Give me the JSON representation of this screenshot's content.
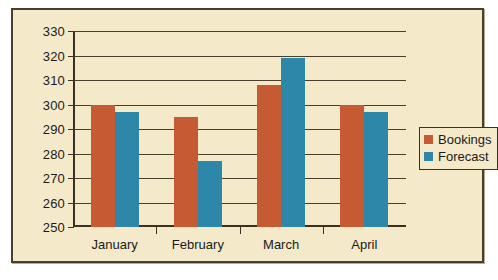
{
  "chart_data": {
    "type": "bar",
    "title": "",
    "xlabel": "",
    "ylabel": "",
    "categories": [
      "January",
      "February",
      "March",
      "April"
    ],
    "series": [
      {
        "name": "Bookings",
        "color": "#c65a32",
        "values": [
          300,
          295,
          308,
          300
        ]
      },
      {
        "name": "Forecast",
        "color": "#2d87a8",
        "values": [
          297,
          277,
          319,
          297
        ]
      }
    ],
    "ylim": [
      250,
      330
    ],
    "yticks": [
      250,
      260,
      270,
      280,
      290,
      300,
      310,
      320,
      330
    ],
    "ytick_labels": [
      "250",
      "260",
      "270",
      "280",
      "290",
      "300",
      "310",
      "320",
      "330"
    ],
    "grid": true,
    "legend_position": "right"
  },
  "legend": {
    "entries": [
      {
        "label": "Bookings",
        "color": "#c65a32"
      },
      {
        "label": "Forecast",
        "color": "#2d87a8"
      }
    ]
  },
  "colors": {
    "background": "#f4e9c8",
    "frame_border": "#4a3f2a",
    "axis": "#3b3123",
    "gridline": "#4a3f2a",
    "bookings": "#c65a32",
    "forecast": "#2d87a8"
  }
}
